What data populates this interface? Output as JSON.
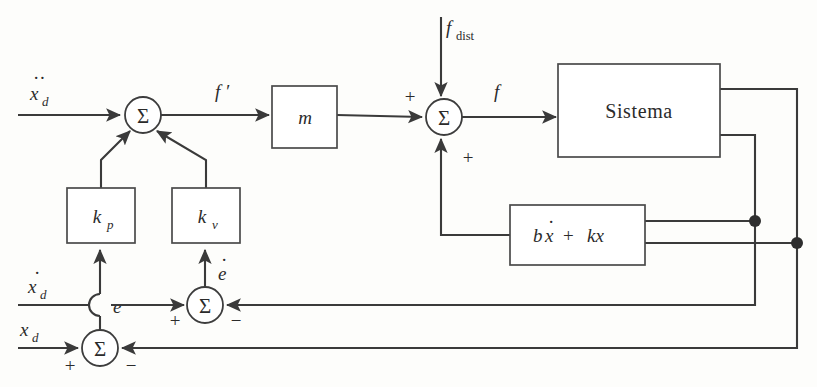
{
  "diagram": {
    "type": "control-block-diagram",
    "background_color": "#fdfdfb",
    "line_color": "#3a3a3a",
    "text_color": "#2b2b2b"
  },
  "inputs": [
    {
      "id": "xdd",
      "base": "x",
      "accent": "..",
      "subscript": "d",
      "label": "ẍ_d",
      "description": "desired acceleration input"
    },
    {
      "id": "xd_dot",
      "base": "x",
      "accent": ".",
      "subscript": "d",
      "label": "ẋ_d",
      "description": "desired velocity input"
    },
    {
      "id": "xd",
      "base": "x",
      "accent": "",
      "subscript": "d",
      "label": "x_d",
      "description": "desired position input"
    },
    {
      "id": "fdist",
      "base": "f",
      "accent": "",
      "subscript": "dist",
      "label": "f_dist",
      "description": "disturbance force input"
    }
  ],
  "blocks": [
    {
      "id": "kp",
      "label": "k",
      "subscript": "p",
      "x": 67,
      "y": 188,
      "w": 68,
      "h": 55
    },
    {
      "id": "kv",
      "label": "k",
      "subscript": "v",
      "x": 172,
      "y": 188,
      "w": 68,
      "h": 55
    },
    {
      "id": "m",
      "label": "m",
      "subscript": "",
      "x": 272,
      "y": 86,
      "w": 65,
      "h": 62
    },
    {
      "id": "sistema",
      "label": "Sistema",
      "subscript": "",
      "x": 558,
      "y": 64,
      "w": 162,
      "h": 93
    },
    {
      "id": "feedback",
      "label": "bẋ + kx",
      "subscript": "",
      "x": 510,
      "y": 205,
      "w": 135,
      "h": 60
    }
  ],
  "summing_junctions": [
    {
      "id": "sum-top",
      "cx": 143,
      "cy": 115,
      "r": 18,
      "symbol": "Σ",
      "signs": []
    },
    {
      "id": "sum-force",
      "cx": 444,
      "cy": 117,
      "r": 18,
      "symbol": "Σ",
      "signs": [
        {
          "sign": "+",
          "position": "left"
        },
        {
          "sign": "+",
          "position": "bottom"
        }
      ]
    },
    {
      "id": "sum-velocity-error",
      "cx": 205,
      "cy": 305,
      "r": 18,
      "symbol": "Σ",
      "signs": [
        {
          "sign": "+",
          "position": "left"
        },
        {
          "sign": "−",
          "position": "right"
        }
      ]
    },
    {
      "id": "sum-position-error",
      "cx": 100,
      "cy": 348,
      "r": 18,
      "symbol": "Σ",
      "signs": [
        {
          "sign": "+",
          "position": "left"
        },
        {
          "sign": "−",
          "position": "right"
        }
      ]
    }
  ],
  "signals": [
    {
      "id": "f-prime",
      "label": "f",
      "prime": "′",
      "x": 215,
      "y": 98,
      "description": "commanded acceleration signal"
    },
    {
      "id": "f-force",
      "label": "f",
      "prime": "",
      "x": 494,
      "y": 98,
      "description": "total force signal"
    },
    {
      "id": "e-error",
      "label": "e",
      "prime": "",
      "x": 113,
      "y": 313,
      "description": "position error"
    },
    {
      "id": "e-dot-error",
      "label": "ė",
      "prime": "",
      "x": 218,
      "y": 278,
      "description": "velocity error"
    }
  ],
  "junction_dots": [
    {
      "id": "dot-velocity-bus",
      "cx": 755,
      "cy": 221,
      "r": 6
    },
    {
      "id": "dot-position-bus",
      "cx": 797,
      "cy": 243,
      "r": 6
    }
  ],
  "line_hop": {
    "id": "wire-hop-e-over-xdot",
    "x": 100,
    "y": 305,
    "radius": 11,
    "description": "semicircular jump where error line crosses velocity input line"
  },
  "buses": [
    {
      "id": "velocity-feedback-bus",
      "x": 755,
      "from_y": 135,
      "to_y": 305,
      "source": "sistema-lower-output"
    },
    {
      "id": "position-feedback-bus",
      "x": 797,
      "from_y": 89,
      "to_y": 348,
      "source": "sistema-upper-output"
    }
  ]
}
